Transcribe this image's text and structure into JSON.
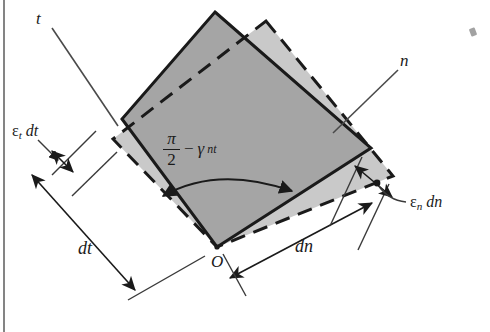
{
  "figure": {
    "kind": "engineering-strain-diagram",
    "background_color": "#ffffff",
    "ink_color": "#1a1a1a",
    "fill_dark": "#a9a9a9",
    "fill_light": "#c9c9c9"
  },
  "labels": {
    "axis_t": "t",
    "axis_n": "n",
    "origin": "O",
    "dim_dt": "dt",
    "dim_dn": "dn",
    "strain_t": {
      "epsilon": "ε",
      "sub": "t",
      "diff": "dt"
    },
    "strain_n": {
      "epsilon": "ε",
      "sub": "n",
      "diff": "dn"
    },
    "angle": {
      "numerator": "π",
      "denominator": "2",
      "operator": "−",
      "gamma": "γ",
      "gamma_sub": "nt"
    }
  },
  "geometry": {
    "solid_square": {
      "top": [
        215,
        12
      ],
      "left": [
        122,
        119
      ],
      "bottom": [
        217,
        247
      ],
      "right": [
        371,
        148
      ],
      "stroke": "#1a1a1a",
      "style": "solid"
    },
    "dashed_square": {
      "top": [
        266,
        21
      ],
      "left": [
        113,
        139
      ],
      "bottom": [
        217,
        247
      ],
      "right": [
        393,
        176
      ],
      "stroke": "#1a1a1a",
      "style": "dashed"
    },
    "origin_point": [
      217,
      247
    ]
  }
}
